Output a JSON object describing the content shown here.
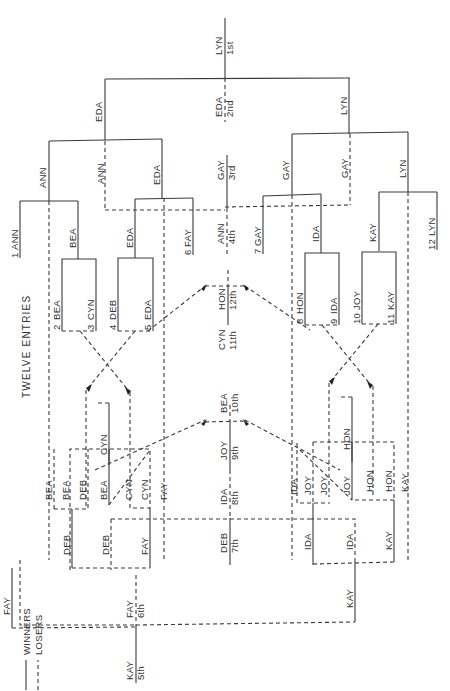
{
  "title": "TWELVE ENTRIES",
  "legend": {
    "winners": "WINNERS",
    "losers": "LOSERS"
  },
  "entries": [
    {
      "seed": "1",
      "name": "ANN"
    },
    {
      "seed": "2",
      "name": "BEA"
    },
    {
      "seed": "3",
      "name": "CYN"
    },
    {
      "seed": "4",
      "name": "DEB"
    },
    {
      "seed": "5",
      "name": "EDA"
    },
    {
      "seed": "6",
      "name": "FAY"
    },
    {
      "seed": "7",
      "name": "GAY"
    },
    {
      "seed": "8",
      "name": "HON"
    },
    {
      "seed": "9",
      "name": "IDA"
    },
    {
      "seed": "10",
      "name": "JOY"
    },
    {
      "seed": "11",
      "name": "KAY"
    },
    {
      "seed": "12",
      "name": "LYN"
    }
  ],
  "placings": [
    {
      "place": "1st",
      "name": "LYN"
    },
    {
      "place": "2nd",
      "name": "EDA"
    },
    {
      "place": "3rd",
      "name": "GAY"
    },
    {
      "place": "4th",
      "name": "ANN"
    },
    {
      "place": "5th",
      "name": "KAY"
    },
    {
      "place": "6th",
      "name": "FAY"
    },
    {
      "place": "7th",
      "name": "DEB"
    },
    {
      "place": "8th",
      "name": "IDA"
    },
    {
      "place": "9th",
      "name": "JOY"
    },
    {
      "place": "10th",
      "name": "BEA"
    },
    {
      "place": "11th",
      "name": "CYN"
    },
    {
      "place": "12th",
      "name": "HON"
    }
  ],
  "winners_bracket": {
    "r1": [
      "BEA",
      "EDA",
      "IDA",
      "KAY"
    ],
    "r2": [
      "ANN",
      "EDA",
      "GAY",
      "LYN"
    ],
    "semis": [
      "ANN",
      "EDA",
      "GAY",
      "LYN"
    ],
    "final": [
      "EDA",
      "LYN"
    ]
  },
  "losers_bracket": {
    "left": [
      "BEA",
      "BEA",
      "DEB",
      "BEA",
      "CYN",
      "CYN",
      "FAY",
      "CYN",
      "DEB",
      "DEB",
      "FAY",
      "FAY"
    ],
    "right": [
      "IDA",
      "JOY",
      "JOY",
      "JOY",
      "HON",
      "HON",
      "KAY",
      "HON",
      "IDA",
      "IDA",
      "KAY",
      "KAY"
    ],
    "mid": [
      "ANN",
      "GAY"
    ]
  }
}
